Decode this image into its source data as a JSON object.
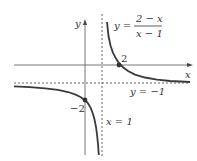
{
  "figure": {
    "function_label": {
      "lhs": "y =",
      "numerator": "2 − x",
      "denominator": "x − 1"
    },
    "axis_labels": {
      "x": "x",
      "y": "y"
    },
    "asymptotes": {
      "vertical": {
        "label": "x = 1",
        "value": 1
      },
      "horizontal": {
        "label": "y = −1",
        "value": -1
      }
    },
    "points": [
      {
        "label": "2",
        "x": 2,
        "y": 0,
        "kind": "x-intercept"
      },
      {
        "label": "−2",
        "x": 0,
        "y": -2,
        "kind": "y-intercept"
      }
    ],
    "colors": {
      "curve": "#3a3a3a",
      "axis": "#555555",
      "dashed": "#555555",
      "text": "#333333"
    }
  }
}
